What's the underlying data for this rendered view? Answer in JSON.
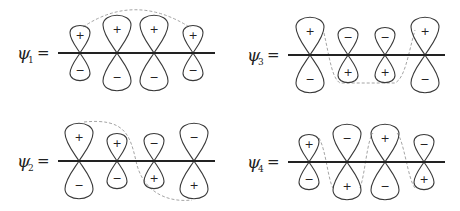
{
  "diagram": {
    "colors": {
      "orbital_outline": "#3a3a3a",
      "axis": "#222222",
      "node_curve": "#9a9a9a"
    },
    "panels": [
      {
        "id": "psi1",
        "symbol": "ψ",
        "subscript": "1",
        "equals": "=",
        "label_x": 17,
        "axis_y": 53,
        "axis_x1": 58,
        "axis_x2": 215,
        "orbitals": [
          {
            "cx": 80,
            "size": "small",
            "top": "+",
            "bottom": "−"
          },
          {
            "cx": 117,
            "size": "large",
            "top": "+",
            "bottom": "−"
          },
          {
            "cx": 154,
            "size": "large",
            "top": "+",
            "bottom": "−"
          },
          {
            "cx": 193,
            "size": "small",
            "top": "+",
            "bottom": "−"
          }
        ],
        "nodes": 0
      },
      {
        "id": "psi2",
        "symbol": "ψ",
        "subscript": "2",
        "equals": "=",
        "label_x": 17,
        "axis_y": 161,
        "axis_x1": 58,
        "axis_x2": 215,
        "orbitals": [
          {
            "cx": 79,
            "size": "large",
            "top": "+",
            "bottom": "−"
          },
          {
            "cx": 117,
            "size": "small",
            "top": "+",
            "bottom": "−"
          },
          {
            "cx": 154,
            "size": "small",
            "top": "−",
            "bottom": "+"
          },
          {
            "cx": 194,
            "size": "large",
            "top": "−",
            "bottom": "+"
          }
        ],
        "nodes": 1
      },
      {
        "id": "psi3",
        "symbol": "ψ",
        "subscript": "3",
        "equals": "=",
        "label_x": 247,
        "axis_y": 55,
        "axis_x1": 288,
        "axis_x2": 445,
        "orbitals": [
          {
            "cx": 310,
            "size": "large",
            "top": "+",
            "bottom": "−"
          },
          {
            "cx": 348,
            "size": "small",
            "top": "−",
            "bottom": "+"
          },
          {
            "cx": 385,
            "size": "small",
            "top": "−",
            "bottom": "+"
          },
          {
            "cx": 425,
            "size": "large",
            "top": "+",
            "bottom": "−"
          }
        ],
        "nodes": 2
      },
      {
        "id": "psi4",
        "symbol": "ψ",
        "subscript": "4",
        "equals": "=",
        "label_x": 247,
        "axis_y": 162,
        "axis_x1": 288,
        "axis_x2": 445,
        "orbitals": [
          {
            "cx": 309,
            "size": "small",
            "top": "+",
            "bottom": "−"
          },
          {
            "cx": 347,
            "size": "large",
            "top": "−",
            "bottom": "+"
          },
          {
            "cx": 385,
            "size": "large",
            "top": "+",
            "bottom": "−"
          },
          {
            "cx": 424,
            "size": "small",
            "top": "−",
            "bottom": "+"
          }
        ],
        "nodes": 3
      }
    ]
  }
}
